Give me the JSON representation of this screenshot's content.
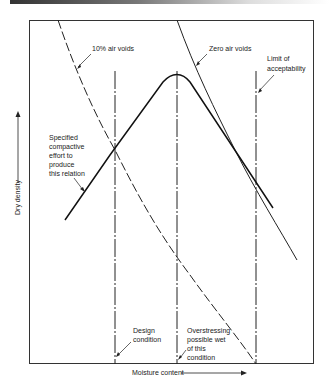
{
  "diagram": {
    "axes": {
      "x_label": "Moisture content",
      "y_label": "Dry density"
    },
    "curves": {
      "air_voids_10": "10% air voids",
      "zero_air_voids": "Zero air voids",
      "compaction_curve": [
        "Specified",
        "compactive",
        "effort to",
        "produce",
        "this relation"
      ]
    },
    "vertical_lines": {
      "design_condition": [
        "Design",
        "condition"
      ],
      "overstressing": [
        "Overstressing",
        "possible wet",
        "of this",
        "condition"
      ],
      "limit": [
        "Limit of",
        "acceptability"
      ]
    }
  }
}
